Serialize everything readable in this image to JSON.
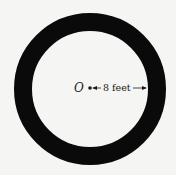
{
  "diagram": {
    "center_label": "O",
    "radius_label": "8 feet",
    "ring_color": "#0a0a0a",
    "background_color": "#f5f5f3",
    "center": [
      90,
      89
    ],
    "outer_radius": 76,
    "inner_radius": 58
  }
}
